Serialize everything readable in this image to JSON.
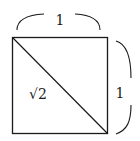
{
  "diagram": {
    "type": "geometry",
    "shape": "square",
    "labels": {
      "top_side": "1",
      "right_side": "1",
      "diagonal": "√2"
    },
    "colors": {
      "stroke": "#1a1a1a",
      "background": "#ffffff"
    }
  }
}
